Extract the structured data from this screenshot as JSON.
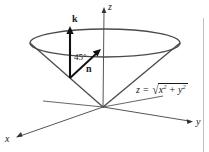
{
  "figure": {
    "axes": {
      "z_label": "z",
      "y_label": "y",
      "x_label": "x"
    },
    "vectors": {
      "k_label": "k",
      "n_label": "n"
    },
    "angle": {
      "value": "45",
      "unit": "°",
      "text": "45°"
    },
    "equation": {
      "lhs": "z",
      "operator": "=",
      "radical_sign": "√",
      "term1_base": "x",
      "term1_exp": "2",
      "plus": "+",
      "term2_base": "y",
      "term2_exp": "2",
      "full_text": "z = √(x² + y²)"
    },
    "colors": {
      "stroke": "#4a4a4a",
      "heavy_stroke": "#1a1a1a",
      "text": "#1a1a1a",
      "background": "#ffffff",
      "border": "#c8c8c8"
    }
  }
}
